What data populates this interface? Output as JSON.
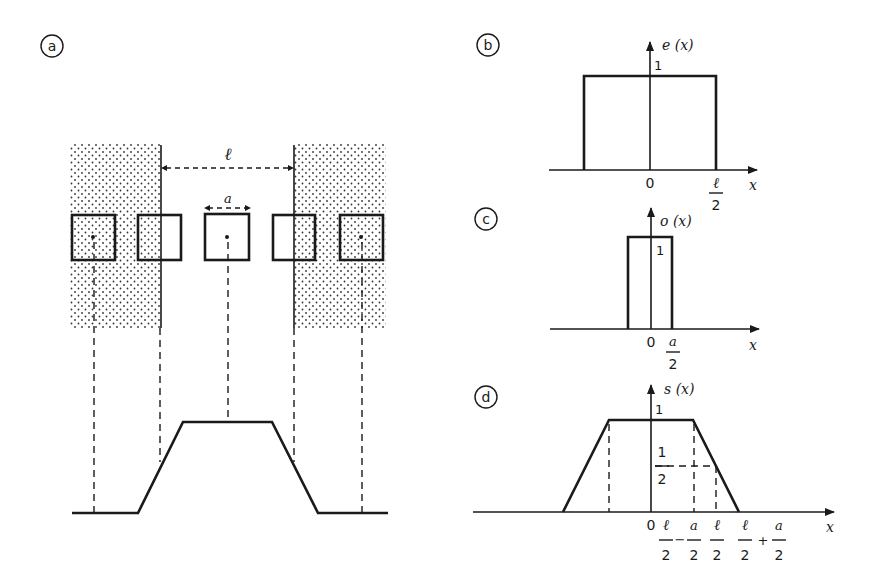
{
  "panels": {
    "a": {
      "label": "a",
      "period_label": "ℓ",
      "aperture_label": "a"
    },
    "b": {
      "label": "b",
      "function_label": "e (x)",
      "y_tick": "1",
      "origin": "0",
      "x_tick_num": "ℓ",
      "x_tick_den": "2",
      "x_axis": "x"
    },
    "c": {
      "label": "c",
      "function_label": "o (x)",
      "y_tick": "1",
      "origin": "0",
      "x_tick_num": "a",
      "x_tick_den": "2",
      "x_axis": "x"
    },
    "d": {
      "label": "d",
      "function_label": "s (x)",
      "y_tick": "1",
      "half_num": "1",
      "half_den": "2",
      "origin": "0",
      "x_ticks": [
        {
          "num": "ℓ",
          "den": "2"
        },
        {
          "op": "−"
        },
        {
          "num": "a",
          "den": "2"
        },
        {
          "num": "ℓ",
          "den": "2"
        },
        {
          "num": "ℓ",
          "den": "2"
        },
        {
          "op": "+"
        },
        {
          "num": "a",
          "den": "2"
        }
      ],
      "x_axis": "x"
    }
  },
  "colors": {
    "ink": "#1a1a1a",
    "background": "#ffffff"
  }
}
